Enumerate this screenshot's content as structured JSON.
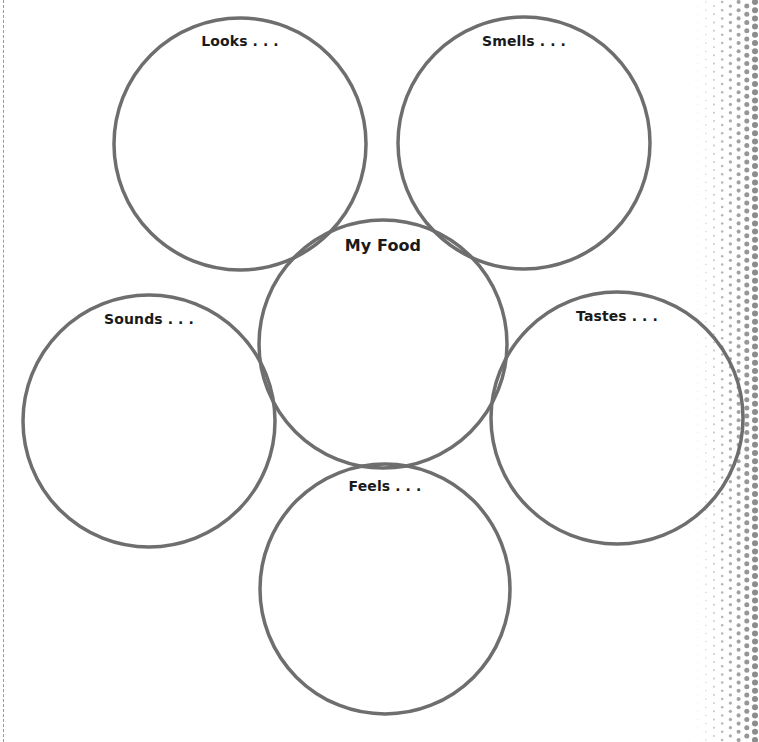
{
  "worksheet": {
    "type": "five-senses web graphic organizer",
    "stroke_color": "#6e6e6e",
    "label_color": "#1a1a1a",
    "center": {
      "label": "My Food",
      "cx": 383,
      "cy": 344,
      "r": 124
    },
    "senses": [
      {
        "id": "looks",
        "label": "Looks . . .",
        "cx": 240,
        "cy": 144,
        "r": 126,
        "label_y": 33
      },
      {
        "id": "smells",
        "label": "Smells . . .",
        "cx": 524,
        "cy": 143,
        "r": 126,
        "label_y": 33
      },
      {
        "id": "sounds",
        "label": "Sounds . . .",
        "cx": 149,
        "cy": 421,
        "r": 126,
        "label_y": 311
      },
      {
        "id": "tastes",
        "label": "Tastes . . .",
        "cx": 617,
        "cy": 418,
        "r": 126,
        "label_y": 308
      },
      {
        "id": "feels",
        "label": "Feels . . .",
        "cx": 385,
        "cy": 589,
        "r": 125,
        "label_y": 478
      }
    ]
  },
  "decorations": {
    "left_cut_line": "dashed",
    "right_edge_pattern": "halftone dots",
    "dot_color": "#8c8c8c"
  }
}
